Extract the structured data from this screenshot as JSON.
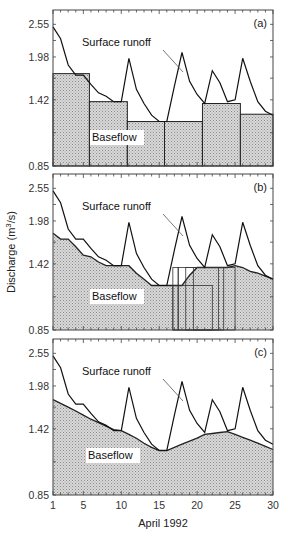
{
  "chart_data": {
    "type": "line",
    "title": "",
    "xlabel": "April 1992",
    "ylabel": "Discharge (m3/s)",
    "ylabel_parts": {
      "pre": "Discharge (m",
      "sup": "3",
      "post": "/s)"
    },
    "yscale": "log",
    "ylim": [
      0.85,
      2.85
    ],
    "xlim": [
      1,
      30
    ],
    "yticks": [
      0.85,
      1.42,
      1.98,
      2.55
    ],
    "ytick_labels": [
      "0.85",
      "1.42",
      "1.98",
      "2.55"
    ],
    "xticks": [
      1,
      5,
      10,
      15,
      20,
      25,
      30
    ],
    "xtick_labels": [
      "1",
      "5",
      "10",
      "15",
      "20",
      "25",
      "30"
    ],
    "days": [
      1,
      2,
      3,
      4,
      5,
      6,
      7,
      8,
      9,
      10,
      11,
      12,
      13,
      14,
      15,
      16,
      17,
      18,
      19,
      20,
      21,
      22,
      23,
      24,
      25,
      26,
      27,
      28,
      29,
      30
    ],
    "surface_runoff": [
      2.5,
      2.28,
      1.86,
      1.72,
      1.72,
      1.6,
      1.5,
      1.46,
      1.4,
      1.4,
      1.96,
      1.54,
      1.38,
      1.26,
      1.2,
      1.2,
      1.58,
      2.05,
      1.64,
      1.48,
      1.38,
      1.78,
      1.62,
      1.4,
      1.42,
      1.96,
      1.64,
      1.4,
      1.3,
      1.26
    ],
    "panels": [
      {
        "label": "(a)",
        "method": "fixed-interval",
        "annotation_runoff": "Surface runoff",
        "annotation_baseflow": "Baseflow",
        "baseflow_steps": [
          {
            "x0": 1,
            "x1": 5.8,
            "value": 1.74
          },
          {
            "x0": 5.8,
            "x1": 10.8,
            "value": 1.4
          },
          {
            "x0": 10.8,
            "x1": 15.7,
            "value": 1.2
          },
          {
            "x0": 15.7,
            "x1": 20.7,
            "value": 1.2
          },
          {
            "x0": 20.7,
            "x1": 25.7,
            "value": 1.38
          },
          {
            "x0": 25.7,
            "x1": 30,
            "value": 1.27
          }
        ]
      },
      {
        "label": "(b)",
        "method": "sliding-interval",
        "annotation_runoff": "Surface runoff",
        "annotation_baseflow": "Baseflow",
        "baseflow": [
          1.8,
          1.72,
          1.72,
          1.62,
          1.52,
          1.5,
          1.44,
          1.4,
          1.4,
          1.4,
          1.4,
          1.32,
          1.26,
          1.2,
          1.2,
          1.2,
          1.2,
          1.2,
          1.3,
          1.38,
          1.38,
          1.38,
          1.38,
          1.38,
          1.4,
          1.38,
          1.34,
          1.32,
          1.29,
          1.26
        ],
        "interval_boxes": [
          {
            "x0": 16.8,
            "x1": 22.0,
            "value": 1.2
          },
          {
            "x0": 16.8,
            "x1": 17.5,
            "value": 1.38
          },
          {
            "x0": 17.5,
            "x1": 22.8,
            "value": 1.38
          },
          {
            "x0": 18.5,
            "x1": 23.5,
            "value": 1.38
          },
          {
            "x0": 19.5,
            "x1": 25.0,
            "value": 1.38
          }
        ]
      },
      {
        "label": "(c)",
        "method": "local-minimum",
        "annotation_runoff": "Surface runoff",
        "annotation_baseflow": "Baseflow",
        "baseflow": [
          1.78,
          1.73,
          1.68,
          1.63,
          1.58,
          1.53,
          1.49,
          1.45,
          1.41,
          1.4,
          1.36,
          1.32,
          1.27,
          1.23,
          1.2,
          1.2,
          1.23,
          1.26,
          1.29,
          1.32,
          1.36,
          1.37,
          1.38,
          1.39,
          1.36,
          1.33,
          1.3,
          1.27,
          1.24,
          1.21
        ]
      }
    ],
    "grid": false,
    "legend": "none (inline annotations)"
  }
}
